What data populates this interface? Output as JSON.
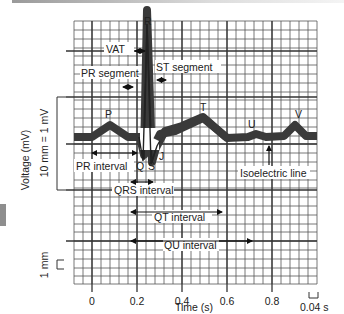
{
  "diagram": {
    "wave_labels": {
      "P": "P",
      "Q": "Q",
      "R": "R",
      "S": "S",
      "J": "J",
      "T": "T",
      "U": "U",
      "V": "V"
    },
    "annotations": {
      "vat": "VAT",
      "pr_segment": "PR segment",
      "st_segment": "ST segment",
      "pr_interval": "PR interval",
      "qrs_interval": "QRS interval",
      "qt_interval": "QT interval",
      "qu_interval": "QU interval",
      "isoelectric_line": "Isoelectric line"
    },
    "y_axis": {
      "label": "Voltage (mV)",
      "scale_label": "10 mm = 1 mV",
      "small_scale_label": "1 mm"
    },
    "x_axis": {
      "label": "Time (s)",
      "ticks": [
        "0",
        "0.2",
        "0.4",
        "0.6",
        "0.8"
      ],
      "scale_label": "0.04 s"
    },
    "colors": {
      "grid": "#4a4a4a",
      "trace": "#3a3a3a",
      "text": "#222222"
    }
  }
}
